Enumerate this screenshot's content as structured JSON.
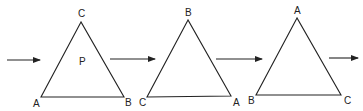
{
  "diagram": {
    "triangles": [
      {
        "apex": "C",
        "bottom_left": "A",
        "bottom_right": "B",
        "center": "P"
      },
      {
        "apex": "B",
        "bottom_left": "C",
        "bottom_right": "A",
        "center": ""
      },
      {
        "apex": "A",
        "bottom_left": "B",
        "bottom_right": "C",
        "center": ""
      }
    ],
    "arrows": 4,
    "colors": {
      "stroke": "#222222",
      "background": "#ffffff"
    }
  }
}
